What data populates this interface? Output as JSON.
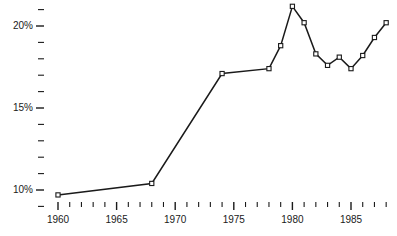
{
  "chart_data": {
    "type": "line",
    "title": "",
    "xlabel": "",
    "ylabel": "",
    "xlim": [
      1960,
      1989
    ],
    "ylim": [
      9.0,
      21.8
    ],
    "grid": false,
    "legend": null,
    "marker": "open-square",
    "line_color": "#1a1a1a",
    "x_tick_labels": [
      "1960",
      "1965",
      "1970",
      "1975",
      "1980",
      "1985"
    ],
    "x_tick_label_values": [
      1960,
      1965,
      1970,
      1975,
      1980,
      1985
    ],
    "x_minor_tick_values": [
      1960,
      1961,
      1962,
      1963,
      1964,
      1965,
      1966,
      1967,
      1968,
      1969,
      1970,
      1971,
      1972,
      1973,
      1974,
      1975,
      1976,
      1977,
      1978,
      1979,
      1980,
      1981,
      1982,
      1983,
      1984,
      1985,
      1986,
      1987,
      1988
    ],
    "y_tick_labels": [
      "20%",
      "15%",
      "10%"
    ],
    "y_tick_label_values": [
      20,
      15,
      10
    ],
    "y_minor_tick_values": [
      9,
      10,
      11,
      12,
      13,
      14,
      15,
      16,
      17,
      18,
      19,
      20,
      21
    ],
    "x": [
      1960,
      1968,
      1974,
      1978,
      1979,
      1980,
      1981,
      1982,
      1983,
      1984,
      1985,
      1986,
      1987,
      1988
    ],
    "values": [
      9.7,
      10.4,
      17.1,
      17.4,
      18.8,
      21.2,
      20.2,
      18.3,
      17.6,
      18.1,
      17.4,
      18.2,
      19.3,
      20.2
    ]
  }
}
